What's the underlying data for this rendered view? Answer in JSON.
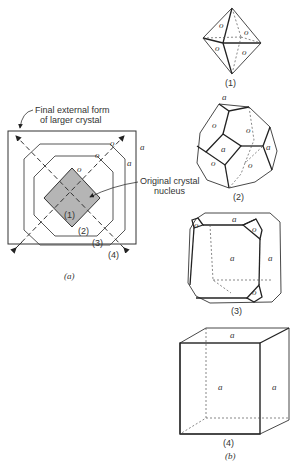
{
  "figure": {
    "part_a": {
      "caption": "(a)",
      "callout_outer_line1": "Final external form",
      "callout_outer_line2": "of larger crystal",
      "callout_nucleus_line1": "Original crystal",
      "callout_nucleus_line2": "nucleus",
      "stage_labels": [
        "(1)",
        "(2)",
        "(3)",
        "(4)"
      ],
      "face_labels": {
        "octahedral": "o",
        "cube": "a"
      }
    },
    "part_b": {
      "caption": "(b)",
      "forms": [
        {
          "label": "(1)",
          "name": "octahedron",
          "faces": [
            "o",
            "o",
            "o",
            "o"
          ]
        },
        {
          "label": "(2)",
          "name": "truncated octahedron",
          "faces": [
            "a",
            "o",
            "o",
            "a",
            "a",
            "o",
            "o"
          ]
        },
        {
          "label": "(3)",
          "name": "truncated cube",
          "faces": [
            "a",
            "o",
            "o",
            "a",
            "a",
            "o"
          ]
        },
        {
          "label": "(4)",
          "name": "cube",
          "faces": [
            "a",
            "a",
            "a"
          ]
        }
      ]
    },
    "colors": {
      "line": "#2a2a2a",
      "nucleus_fill": "#b5b5b5",
      "dashed": "#444444"
    }
  }
}
